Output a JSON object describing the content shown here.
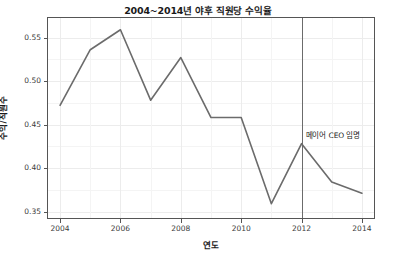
{
  "chart_data": {
    "type": "line",
    "title": "2004~2014년 야후 직원당 수익율",
    "xlabel": "연도",
    "ylabel": "수익/직원수",
    "x": [
      2004,
      2005,
      2006,
      2007,
      2008,
      2009,
      2010,
      2011,
      2012,
      2013,
      2014
    ],
    "values": [
      0.472,
      0.536,
      0.559,
      0.478,
      0.527,
      0.458,
      0.458,
      0.359,
      0.428,
      0.384,
      0.371
    ],
    "series": [
      {
        "name": "수익/직원수",
        "values": [
          0.472,
          0.536,
          0.559,
          0.478,
          0.527,
          0.458,
          0.458,
          0.359,
          0.428,
          0.384,
          0.371
        ]
      }
    ],
    "xlim": [
      2003.6,
      2014.4
    ],
    "ylim": [
      0.3425,
      0.5725
    ],
    "xticks": [
      2004,
      2006,
      2008,
      2010,
      2012,
      2014
    ],
    "xtick_labels": [
      "2004",
      "2006",
      "2008",
      "2010",
      "2012",
      "2014"
    ],
    "yticks": [
      0.35,
      0.4,
      0.45,
      0.5,
      0.55
    ],
    "ytick_labels": [
      "0.35",
      "0.40",
      "0.45",
      "0.50",
      "0.55"
    ],
    "grid": true,
    "legend": "none",
    "line_color": "#6b6b6b",
    "grid_color": "#ececec",
    "panel_border_color": "#555555",
    "background_color": "#ffffff",
    "annotations": [
      {
        "text": "메이어 CEO 임명",
        "x": 2012,
        "y": 0.428,
        "reference_line_x": 2012,
        "reference_line_color": "#6b6b6b"
      }
    ]
  }
}
